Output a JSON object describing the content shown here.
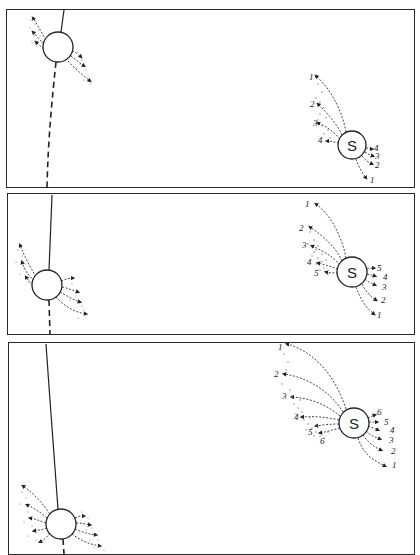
{
  "figure": {
    "star_label": "S",
    "panels": [
      {
        "id": 1,
        "star": {
          "label": "S",
          "cx": 352,
          "cy": 145,
          "r": 14
        },
        "planet": {
          "cx": 58,
          "cy": 47,
          "r": 15
        },
        "star_left_labels": [
          "1",
          "2",
          "3",
          "4"
        ],
        "star_right_labels": [
          "4",
          "3",
          "2",
          "1"
        ]
      },
      {
        "id": 2,
        "star": {
          "label": "S",
          "cx": 352,
          "cy": 272,
          "r": 15
        },
        "planet": {
          "cx": 47,
          "cy": 285,
          "r": 15
        },
        "star_left_labels": [
          "1",
          "2",
          "3",
          "4",
          "5"
        ],
        "star_right_labels": [
          "5",
          "4",
          "3",
          "2",
          "1"
        ]
      },
      {
        "id": 3,
        "star": {
          "label": "S",
          "cx": 354,
          "cy": 423,
          "r": 15
        },
        "planet": {
          "cx": 61,
          "cy": 524,
          "r": 15
        },
        "star_left_labels": [
          "1",
          "2",
          "3",
          "4",
          "5",
          "6"
        ],
        "star_right_labels": [
          "6",
          "5",
          "4",
          "3",
          "2",
          "1"
        ]
      }
    ]
  }
}
